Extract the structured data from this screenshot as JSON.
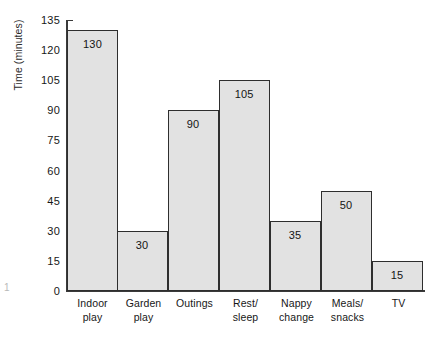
{
  "chart_data": {
    "type": "bar",
    "title": "",
    "xlabel": "",
    "ylabel": "Time (minutes)",
    "ylim": [
      0,
      135
    ],
    "ytick_step": 15,
    "yticks": [
      0,
      15,
      30,
      45,
      60,
      75,
      90,
      105,
      120,
      135
    ],
    "ytick_labels": [
      "0",
      "15",
      "30",
      "45",
      "60",
      "75",
      "90",
      "105",
      "120",
      "135"
    ],
    "categories": [
      "Indoor play",
      "Garden play",
      "Outings",
      "Rest/ sleep",
      "Nappy change",
      "Meals/ snacks",
      "TV"
    ],
    "category_lines": [
      [
        "Indoor",
        "play"
      ],
      [
        "Garden",
        "play"
      ],
      [
        "Outings",
        ""
      ],
      [
        "Rest/",
        "sleep"
      ],
      [
        "Nappy",
        "change"
      ],
      [
        "Meals/",
        "snacks"
      ],
      [
        "TV",
        ""
      ]
    ],
    "values": [
      130,
      30,
      90,
      105,
      35,
      50,
      15
    ],
    "value_labels": [
      "130",
      "30",
      "90",
      "105",
      "35",
      "50",
      "15"
    ],
    "grid": false,
    "legend": null,
    "bar_fill": "#e2e2e2",
    "bar_stroke": "#2e2e2e",
    "axis_color": "#3a3a3a"
  },
  "artifacts": {
    "page_mark": "1"
  }
}
